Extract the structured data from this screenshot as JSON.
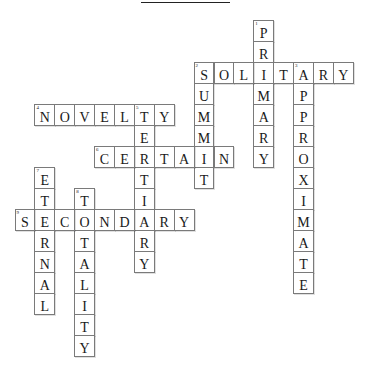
{
  "puzzle": {
    "title": "",
    "words": [
      {
        "number": 1,
        "direction": "down",
        "answer": "PRIMARY",
        "row": 0,
        "col": 12
      },
      {
        "number": 2,
        "direction": "across",
        "answer": "SOLITARY",
        "row": 2,
        "col": 9
      },
      {
        "number": 2,
        "direction": "down",
        "answer": "SUMMIT",
        "row": 2,
        "col": 9
      },
      {
        "number": 3,
        "direction": "down",
        "answer": "APPROXIMATE",
        "row": 2,
        "col": 14
      },
      {
        "number": 4,
        "direction": "across",
        "answer": "NOVELTY",
        "row": 4,
        "col": 1
      },
      {
        "number": 5,
        "direction": "down",
        "answer": "TERTIARY",
        "row": 4,
        "col": 6
      },
      {
        "number": 6,
        "direction": "across",
        "answer": "CERTAIN",
        "row": 6,
        "col": 4
      },
      {
        "number": 7,
        "direction": "down",
        "answer": "ETERNAL",
        "row": 7,
        "col": 1
      },
      {
        "number": 8,
        "direction": "down",
        "answer": "TOTALITY",
        "row": 8,
        "col": 3
      },
      {
        "number": 9,
        "direction": "across",
        "answer": "SECONDARY",
        "row": 9,
        "col": 0
      }
    ]
  }
}
